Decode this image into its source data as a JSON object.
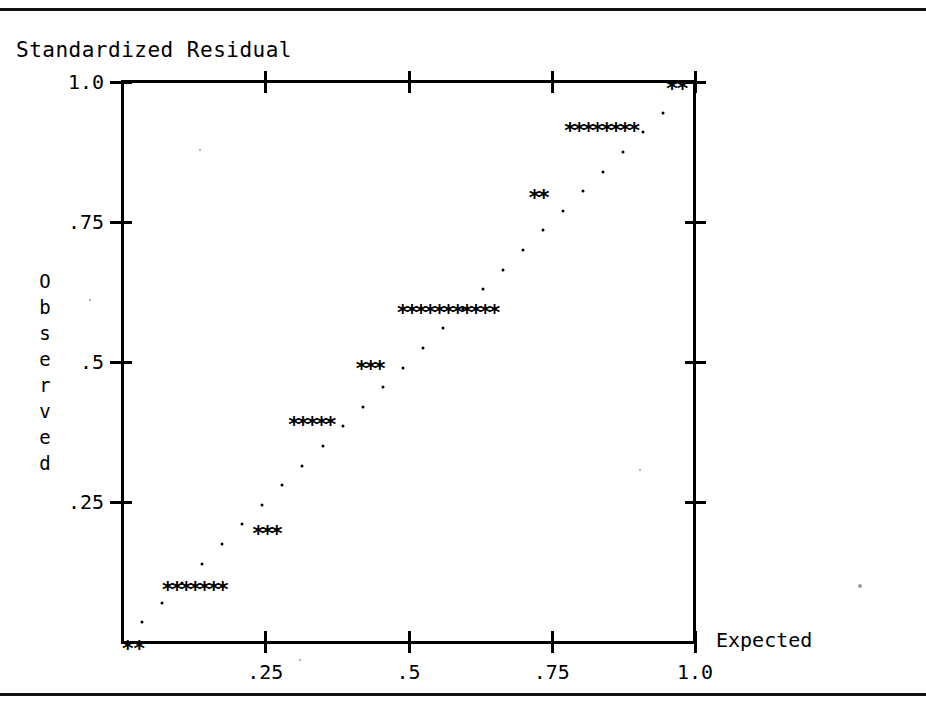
{
  "page": {
    "rules": [
      "top-rule",
      "bottom-rule"
    ]
  },
  "chart_data": {
    "type": "scatter",
    "title": "Standardized Residual",
    "xlabel": "Expected",
    "ylabel": "Observed",
    "xlim": [
      0,
      1.04
    ],
    "ylim": [
      0,
      1.0
    ],
    "grid": false,
    "legend": "none",
    "x_ticks": [
      0.25,
      0.5,
      0.75,
      1.0
    ],
    "x_tick_labels": [
      ".25",
      ".5",
      ".75",
      "1.0"
    ],
    "y_ticks": [
      0.25,
      0.5,
      0.75,
      1.0
    ],
    "y_tick_labels": [
      ".25",
      ".5",
      ".75",
      "1.0"
    ],
    "marker": "*",
    "series": [
      {
        "name": "Observed",
        "marker": "*",
        "points": [
          {
            "x": 0.01,
            "y": 0.0
          },
          {
            "x": 0.03,
            "y": 0.0
          },
          {
            "x": 0.08,
            "y": 0.105
          },
          {
            "x": 0.096,
            "y": 0.105
          },
          {
            "x": 0.112,
            "y": 0.105
          },
          {
            "x": 0.128,
            "y": 0.105
          },
          {
            "x": 0.144,
            "y": 0.105
          },
          {
            "x": 0.16,
            "y": 0.105
          },
          {
            "x": 0.176,
            "y": 0.105
          },
          {
            "x": 0.238,
            "y": 0.205
          },
          {
            "x": 0.254,
            "y": 0.205
          },
          {
            "x": 0.27,
            "y": 0.205
          },
          {
            "x": 0.3,
            "y": 0.4
          },
          {
            "x": 0.316,
            "y": 0.4
          },
          {
            "x": 0.332,
            "y": 0.4
          },
          {
            "x": 0.348,
            "y": 0.4
          },
          {
            "x": 0.364,
            "y": 0.4
          },
          {
            "x": 0.418,
            "y": 0.5
          },
          {
            "x": 0.434,
            "y": 0.5
          },
          {
            "x": 0.45,
            "y": 0.5
          },
          {
            "x": 0.49,
            "y": 0.6
          },
          {
            "x": 0.506,
            "y": 0.6
          },
          {
            "x": 0.522,
            "y": 0.6
          },
          {
            "x": 0.538,
            "y": 0.6
          },
          {
            "x": 0.554,
            "y": 0.6
          },
          {
            "x": 0.57,
            "y": 0.6
          },
          {
            "x": 0.586,
            "y": 0.6
          },
          {
            "x": 0.602,
            "y": 0.6
          },
          {
            "x": 0.618,
            "y": 0.6
          },
          {
            "x": 0.634,
            "y": 0.6
          },
          {
            "x": 0.65,
            "y": 0.6
          },
          {
            "x": 0.72,
            "y": 0.805
          },
          {
            "x": 0.736,
            "y": 0.805
          },
          {
            "x": 0.782,
            "y": 0.925
          },
          {
            "x": 0.798,
            "y": 0.925
          },
          {
            "x": 0.814,
            "y": 0.925
          },
          {
            "x": 0.83,
            "y": 0.925
          },
          {
            "x": 0.846,
            "y": 0.925
          },
          {
            "x": 0.862,
            "y": 0.925
          },
          {
            "x": 0.878,
            "y": 0.925
          },
          {
            "x": 0.894,
            "y": 0.925
          },
          {
            "x": 0.96,
            "y": 1.0
          },
          {
            "x": 0.978,
            "y": 1.0
          }
        ]
      },
      {
        "name": "Reference line",
        "marker": ".",
        "points": [
          {
            "x": 0.035,
            "y": 0.035
          },
          {
            "x": 0.07,
            "y": 0.07
          },
          {
            "x": 0.105,
            "y": 0.105
          },
          {
            "x": 0.14,
            "y": 0.14
          },
          {
            "x": 0.175,
            "y": 0.175
          },
          {
            "x": 0.21,
            "y": 0.21
          },
          {
            "x": 0.245,
            "y": 0.245
          },
          {
            "x": 0.28,
            "y": 0.28
          },
          {
            "x": 0.315,
            "y": 0.315
          },
          {
            "x": 0.35,
            "y": 0.35
          },
          {
            "x": 0.385,
            "y": 0.385
          },
          {
            "x": 0.42,
            "y": 0.42
          },
          {
            "x": 0.455,
            "y": 0.455
          },
          {
            "x": 0.49,
            "y": 0.49
          },
          {
            "x": 0.525,
            "y": 0.525
          },
          {
            "x": 0.56,
            "y": 0.56
          },
          {
            "x": 0.595,
            "y": 0.595
          },
          {
            "x": 0.63,
            "y": 0.63
          },
          {
            "x": 0.665,
            "y": 0.665
          },
          {
            "x": 0.7,
            "y": 0.7
          },
          {
            "x": 0.735,
            "y": 0.735
          },
          {
            "x": 0.77,
            "y": 0.77
          },
          {
            "x": 0.805,
            "y": 0.805
          },
          {
            "x": 0.84,
            "y": 0.84
          },
          {
            "x": 0.875,
            "y": 0.875
          },
          {
            "x": 0.91,
            "y": 0.91
          },
          {
            "x": 0.945,
            "y": 0.945
          }
        ]
      }
    ]
  },
  "colors": {
    "ink": "#000000",
    "paper": "#ffffff",
    "faint": "#7a7a7a"
  }
}
